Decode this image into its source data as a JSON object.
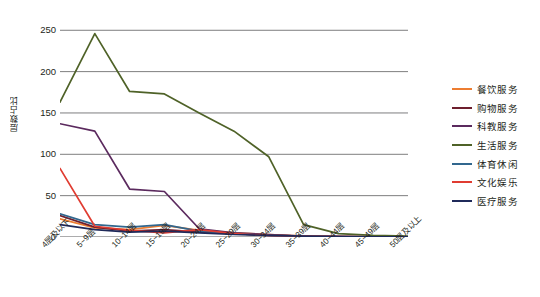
{
  "chart_data": {
    "type": "line",
    "title": "",
    "xlabel": "",
    "ylabel": "层数占比",
    "ylim": [
      0,
      260
    ],
    "yticks": [
      0,
      50,
      100,
      150,
      200,
      250
    ],
    "grid": true,
    "legend_position": "right",
    "categories": [
      "4层及以下",
      "5~9层",
      "10~14层",
      "15~19层",
      "20~24层",
      "25~29层",
      "30~34层",
      "35~39层",
      "40~44层",
      "45~49层",
      "50层及以上"
    ],
    "series": [
      {
        "name": "餐饮服务",
        "color": "#ED7D31",
        "values": [
          22,
          11,
          9,
          14,
          8,
          5,
          3,
          1,
          0.6,
          0.4,
          0.3
        ]
      },
      {
        "name": "购物服务",
        "color": "#6E1F2E",
        "values": [
          26,
          12,
          7,
          9,
          6,
          4,
          2,
          1,
          0.5,
          0.3,
          0.2
        ]
      },
      {
        "name": "科教服务",
        "color": "#5B2A5E",
        "values": [
          137,
          128,
          58,
          55,
          10,
          5,
          3,
          1,
          0.5,
          0.3,
          0.2
        ]
      },
      {
        "name": "生活服务",
        "color": "#4F6228",
        "values": [
          163,
          246,
          176,
          173,
          150,
          128,
          97,
          15,
          4,
          2,
          1
        ]
      },
      {
        "name": "体育休闲",
        "color": "#31678E",
        "values": [
          28,
          15,
          12,
          15,
          7,
          4,
          2,
          1,
          0.5,
          0.3,
          0.2
        ]
      },
      {
        "name": "文化娱乐",
        "color": "#E03C31",
        "values": [
          83,
          13,
          8,
          5,
          9,
          4,
          2,
          1,
          0.5,
          0.3,
          0.2
        ]
      },
      {
        "name": "医疗服务",
        "color": "#1F2A5A",
        "values": [
          15,
          9,
          6,
          7,
          5,
          3,
          2,
          1,
          0.5,
          0.3,
          0.2
        ]
      }
    ]
  }
}
